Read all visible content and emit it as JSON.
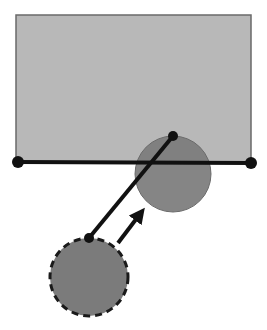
{
  "diagram": {
    "canvas": {
      "width": 267,
      "height": 330,
      "background": "#ffffff"
    },
    "colors": {
      "rect_fill": "#b8b8b8",
      "rect_stroke": "#6a6a6a",
      "circle_fill": "#7b7b7b",
      "circle_stroke": "#6a6a6a",
      "line": "#111111",
      "dot": "#111111",
      "arrow": "#111111",
      "dashed_stroke": "#1a1a1a"
    },
    "rectangle": {
      "x": 16,
      "y": 15,
      "width": 235,
      "height": 147
    },
    "baseline": {
      "x1": 18,
      "y1": 162,
      "x2": 251,
      "y2": 163
    },
    "baseline_endpoints": [
      {
        "cx": 18,
        "cy": 162,
        "r": 6
      },
      {
        "cx": 251,
        "cy": 163,
        "r": 6
      }
    ],
    "solid_circle": {
      "cx": 173,
      "cy": 174,
      "r": 38
    },
    "dashed_circle": {
      "cx": 89,
      "cy": 277,
      "r": 39,
      "dash": "7 5"
    },
    "rod": {
      "x1": 89,
      "y1": 238,
      "x2": 173,
      "y2": 136
    },
    "rod_endpoints": [
      {
        "cx": 173,
        "cy": 136,
        "r": 5
      },
      {
        "cx": 89,
        "cy": 238,
        "r": 5
      }
    ],
    "arrow": {
      "x1": 118,
      "y1": 243,
      "x2": 145,
      "y2": 208
    }
  }
}
